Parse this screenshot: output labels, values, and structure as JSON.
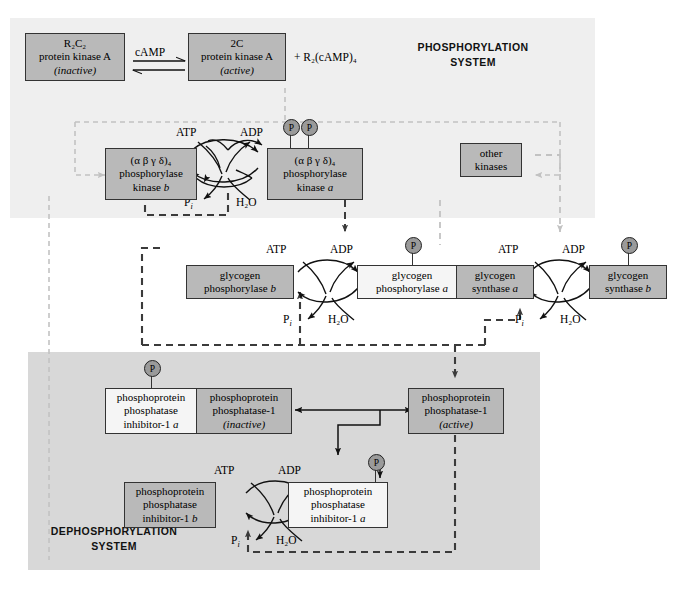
{
  "figure": {
    "type": "diagram"
  },
  "panels": {
    "phosphorylation": {
      "label": "PHOSPHORYLATION\nSYSTEM",
      "fill": "#efefef"
    },
    "dephosphorylation": {
      "label": "DEPHOSPHORYLATION\nSYSTEM",
      "fill": "#d8d8d8"
    }
  },
  "colors": {
    "box_gray": "#b9b9b9",
    "box_white": "#f5f5f5",
    "outline": "#333333",
    "dash_dark": "#3b3b3b",
    "dash_light": "#c2c2c2",
    "phospho_circle": "#9a9a9a"
  },
  "nodes": {
    "pka_inactive": {
      "l1": "R₂C₂",
      "l2": "protein kinase A",
      "l3": "(inactive)",
      "shade": "gray"
    },
    "pka_active": {
      "l1": "2C",
      "l2": "protein kinase A",
      "l3": "(active)",
      "shade": "gray"
    },
    "phos_kinase_b": {
      "l1": "(α β γ δ)₄",
      "l2": "phosphorylase",
      "l3": "kinase b",
      "shade": "gray"
    },
    "phos_kinase_a": {
      "l1": "(α β γ δ)₄",
      "l2": "phosphorylase",
      "l3": "kinase a",
      "shade": "gray"
    },
    "other_kinases": {
      "l1": "other",
      "l2": "kinases",
      "shade": "gray"
    },
    "glyc_phos_b": {
      "l1": "glycogen",
      "l2": "phosphorylase b",
      "shade": "gray"
    },
    "glyc_phos_a": {
      "l1": "glycogen",
      "l2": "phosphorylase a",
      "shade": "gray"
    },
    "glyc_syn_a": {
      "l1": "glycogen",
      "l2": "synthase a",
      "shade": "gray"
    },
    "glyc_syn_b": {
      "l1": "glycogen",
      "l2": "synthase b",
      "shade": "gray"
    },
    "ppi1_a_top": {
      "l1": "phosphoprotein",
      "l2": "phosphatase",
      "l3": "inhibitor-1 a",
      "shade": "white"
    },
    "pp1_inactive": {
      "l1": "phosphoprotein",
      "l2": "phosphatase-1",
      "l3": "(inactive)",
      "shade": "gray"
    },
    "pp1_active": {
      "l1": "phosphoprotein",
      "l2": "phosphatase-1",
      "l3": "(active)",
      "shade": "gray"
    },
    "ppi1_b": {
      "l1": "phosphoprotein",
      "l2": "phosphatase",
      "l3": "inhibitor-1 b",
      "shade": "gray"
    },
    "ppi1_a_bottom": {
      "l1": "phosphoprotein",
      "l2": "phosphatase",
      "l3": "inhibitor-1 a",
      "shade": "white"
    }
  },
  "labels": {
    "camp": "cAMP",
    "plus_r2camp4": "+ R₂(cAMP)₄",
    "atp": "ATP",
    "adp": "ADP",
    "pi": "P",
    "pi_sub": "i",
    "h2o": "H₂O",
    "phosphoryl_group": "P"
  },
  "reaction_cycles": [
    {
      "name": "phosphorylase-kinase-cycle",
      "substrate": "phosphorylase kinase b",
      "product": "phosphorylase kinase a",
      "in_top": "ATP",
      "out_top": "ADP",
      "in_bottom": "H₂O",
      "out_bottom": "Pᵢ",
      "phosphates": 2
    },
    {
      "name": "glycogen-phosphorylase-cycle",
      "substrate": "glycogen phosphorylase b",
      "product": "glycogen phosphorylase a",
      "in_top": "ATP",
      "out_top": "ADP",
      "in_bottom": "H₂O",
      "out_bottom": "Pᵢ",
      "phosphates": 1
    },
    {
      "name": "glycogen-synthase-cycle",
      "substrate": "glycogen synthase a",
      "product": "glycogen synthase b",
      "in_top": "ATP",
      "out_top": "ADP",
      "in_bottom": "H₂O",
      "out_bottom": "Pᵢ",
      "phosphates": 1
    },
    {
      "name": "inhibitor-1-cycle",
      "substrate": "phosphoprotein phosphatase inhibitor-1 b",
      "product": "phosphoprotein phosphatase inhibitor-1 a",
      "in_top": "ATP",
      "out_top": "ADP",
      "in_bottom": "H₂O",
      "out_bottom": "Pᵢ",
      "phosphates": 1
    }
  ]
}
